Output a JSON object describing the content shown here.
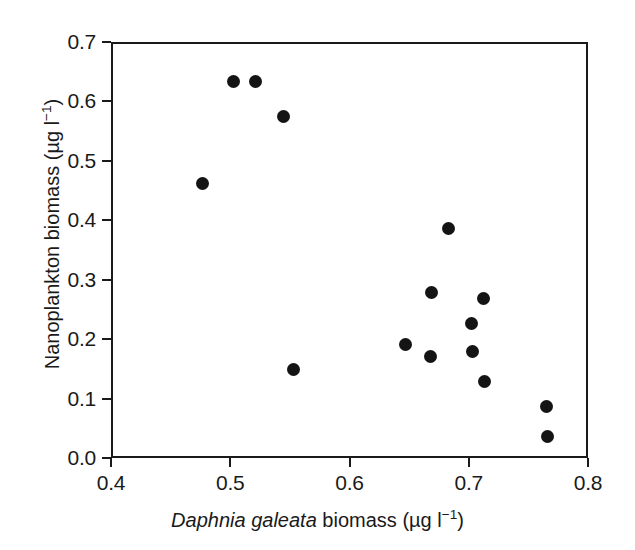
{
  "chart_data": {
    "type": "scatter",
    "title": "",
    "xlabel": "Daphnia galeata biomass (µg l⁻¹)",
    "ylabel": "Nanoplankton biomass (µg l⁻¹)",
    "xlabel_parts": {
      "species": "Daphnia galeata",
      "rest": " biomass (µg l",
      "exponent": "−1",
      "tail": ")"
    },
    "ylabel_parts": {
      "main": "Nanoplankton biomass (µg l",
      "exponent": "−1",
      "tail": ")"
    },
    "xlim": [
      0.4,
      0.8
    ],
    "ylim": [
      0.0,
      0.7
    ],
    "xticks": [
      0.4,
      0.5,
      0.6,
      0.7,
      0.8
    ],
    "yticks": [
      0.0,
      0.1,
      0.2,
      0.3,
      0.4,
      0.5,
      0.6,
      0.7
    ],
    "xtick_labels": [
      "0.4",
      "0.5",
      "0.6",
      "0.7",
      "0.8"
    ],
    "ytick_labels": [
      "0.0",
      "0.1",
      "0.2",
      "0.3",
      "0.4",
      "0.5",
      "0.6",
      "0.7"
    ],
    "grid": false,
    "legend": false,
    "marker": "filled-circle",
    "marker_color": "#141414",
    "frame_color": "#1a1a1a",
    "background": "#ffffff",
    "n_points": 16,
    "points": [
      {
        "x": 0.477,
        "y": 0.462
      },
      {
        "x": 0.503,
        "y": 0.634
      },
      {
        "x": 0.521,
        "y": 0.634
      },
      {
        "x": 0.545,
        "y": 0.574
      },
      {
        "x": 0.553,
        "y": 0.149
      },
      {
        "x": 0.647,
        "y": 0.191
      },
      {
        "x": 0.668,
        "y": 0.17
      },
      {
        "x": 0.669,
        "y": 0.278
      },
      {
        "x": 0.683,
        "y": 0.387
      },
      {
        "x": 0.702,
        "y": 0.226
      },
      {
        "x": 0.703,
        "y": 0.179
      },
      {
        "x": 0.712,
        "y": 0.268
      },
      {
        "x": 0.713,
        "y": 0.129
      },
      {
        "x": 0.765,
        "y": 0.087
      },
      {
        "x": 0.766,
        "y": 0.037
      }
    ]
  }
}
